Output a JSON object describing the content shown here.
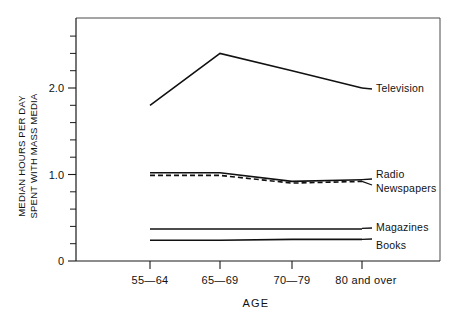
{
  "chart_data": {
    "type": "line",
    "title": "",
    "subtitle": "",
    "xlabel": "AGE",
    "ylabel": "MEDIAN HOURS PER DAY SPENT WITH MASS MEDIA",
    "ylabel_line1": "MEDIAN HOURS PER DAY",
    "ylabel_line2": "SPENT WITH MASS MEDIA",
    "categories": [
      "55—64",
      "65—69",
      "70—79",
      "80 and over"
    ],
    "ylim": [
      0,
      2.75
    ],
    "xlim": [
      0,
      3
    ],
    "yticks_major": [
      0,
      1.0,
      2.0
    ],
    "ytick_labels": [
      "0",
      "1.0",
      "2.0"
    ],
    "yticks_minor": [
      0.2,
      0.4,
      0.6,
      0.8,
      1.2,
      1.4,
      1.6,
      1.8,
      2.2,
      2.4,
      2.6
    ],
    "grid": false,
    "legend_position": "right-of-plot-inline",
    "series": [
      {
        "name": "Television",
        "style": "solid",
        "color": "#111111",
        "values": [
          1.8,
          2.4,
          2.2,
          2.0
        ]
      },
      {
        "name": "Radio",
        "style": "solid",
        "color": "#111111",
        "values": [
          1.02,
          1.02,
          0.92,
          0.94
        ]
      },
      {
        "name": "Newspapers",
        "style": "dashed",
        "color": "#111111",
        "values": [
          0.99,
          0.99,
          0.9,
          0.92
        ]
      },
      {
        "name": "Magazines",
        "style": "solid",
        "color": "#111111",
        "values": [
          0.37,
          0.37,
          0.37,
          0.37
        ]
      },
      {
        "name": "Books",
        "style": "solid",
        "color": "#111111",
        "values": [
          0.24,
          0.24,
          0.25,
          0.25
        ]
      }
    ],
    "annotations": []
  },
  "labels": {
    "television": "Television",
    "radio": "Radio",
    "newspapers": "Newspapers",
    "magazines": "Magazines",
    "books": "Books",
    "ytick_0": "0",
    "ytick_1": "1.0",
    "ytick_2": "2.0",
    "xtick_0": "55—64",
    "xtick_1": "65—69",
    "xtick_2": "70—79",
    "xtick_3": "80 and over",
    "axis_title_x": "AGE",
    "axis_title_y_line1": "MEDIAN HOURS PER DAY",
    "axis_title_y_line2": "SPENT WITH MASS MEDIA"
  },
  "colors": {
    "ink": "#111111",
    "frame": "#4a4a4a",
    "background": "#ffffff"
  }
}
